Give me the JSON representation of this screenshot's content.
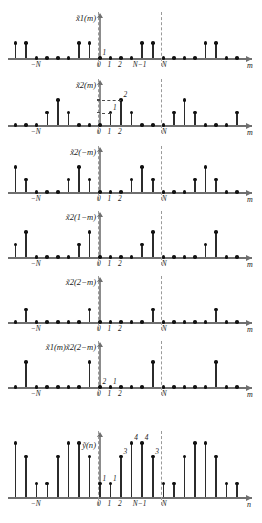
{
  "figure": {
    "caption": "",
    "x_axis_name_m": "m",
    "x_axis_name_n": "n",
    "period_label_N": "N",
    "period_label_negN": "−N",
    "period_label_Nm1": "N−1",
    "tick_0": "0",
    "tick_1": "1",
    "tick_2": "2",
    "colors": {
      "stem": "#2b2b2b",
      "axis": "#6f6f6f",
      "dashed": "#9a9a9a",
      "text": "#1a1a1a"
    }
  },
  "panels": [
    {
      "id": "panel-x1m",
      "title": "x̃1(m)",
      "title_parts": {
        "base": "x̃",
        "sub": "1",
        "arg": "(m)"
      },
      "xaxis": "m",
      "value_labels": [
        {
          "text": "1",
          "index": 0
        }
      ],
      "ticks": [
        "−N",
        "0",
        "1",
        "2",
        "N−1",
        "N"
      ],
      "samples": [
        0,
        0,
        0,
        0,
        1,
        1,
        1,
        1,
        0,
        0,
        0,
        1,
        1,
        1,
        1,
        0,
        0,
        0,
        1,
        1,
        1,
        1,
        0,
        0,
        0
      ],
      "description": "periodic rectangular pulse train of amplitude 1, period N"
    },
    {
      "id": "panel-x2m",
      "title": "x̃2(m)",
      "title_parts": {
        "base": "x̃",
        "sub": "2",
        "arg": "(m)"
      },
      "xaxis": "m",
      "value_labels": [
        {
          "text": "1",
          "index": 1
        },
        {
          "text": "2",
          "index": 2
        }
      ],
      "ticks": [
        "−N",
        "0",
        "1",
        "2",
        "N"
      ],
      "samples": [
        0,
        1,
        2,
        1,
        0,
        0,
        0,
        0,
        1,
        2,
        1,
        0,
        0,
        0,
        0,
        1,
        2,
        1,
        0,
        0,
        0,
        0,
        1,
        2,
        1
      ],
      "description": "periodic triangular pulse, peak value 2 at m=2"
    },
    {
      "id": "panel-x2-negm",
      "title": "x̃2(−m)",
      "title_parts": {
        "base": "x̃",
        "sub": "2",
        "arg": "(−m)"
      },
      "xaxis": "m",
      "value_labels": [],
      "ticks": [
        "−N",
        "0",
        "1",
        "2",
        "N"
      ],
      "samples": [
        0,
        0,
        0,
        1,
        2,
        1,
        0,
        0,
        0,
        0,
        1,
        2,
        1,
        0,
        0,
        0,
        0,
        1,
        2,
        1,
        0,
        0,
        0,
        0,
        1
      ],
      "description": "time reversed x2"
    },
    {
      "id": "panel-x2-1-m",
      "title": "x̃2(1−m)",
      "title_parts": {
        "base": "x̃",
        "sub": "2",
        "arg": "(1−m)"
      },
      "xaxis": "m",
      "value_labels": [],
      "ticks": [
        "−N",
        "0",
        "1",
        "2",
        "N"
      ],
      "samples": [
        0,
        0,
        0,
        0,
        1,
        2,
        1,
        0,
        0,
        0,
        0,
        1,
        2,
        1,
        0,
        0,
        0,
        0,
        1,
        2,
        1,
        0,
        0,
        0,
        0
      ],
      "description": "time reversed x2 shifted by 1"
    },
    {
      "id": "panel-x2-2-m",
      "title": "x̃2(2−m)",
      "title_parts": {
        "base": "x̃",
        "sub": "2",
        "arg": "(2−m)"
      },
      "xaxis": "m",
      "value_labels": [],
      "ticks": [
        "−N",
        "0",
        "1",
        "2",
        "N"
      ],
      "samples": [
        0,
        0,
        0,
        0,
        0,
        1,
        2,
        1,
        0,
        0,
        0,
        0,
        1,
        2,
        1,
        0,
        0,
        0,
        0,
        1,
        2,
        1,
        0,
        0,
        0
      ],
      "description": "time reversed x2 shifted by 2"
    },
    {
      "id": "panel-product",
      "title": "x̃1(m)x̃2(2−m)",
      "title_parts": {
        "base": "x̃",
        "sub": "1",
        "arg": "(m)",
        "base2": "x̃",
        "sub2": "2",
        "arg2": "(2−m)"
      },
      "xaxis": "m",
      "value_labels": [
        {
          "text": "2",
          "index": 0
        },
        {
          "text": "1",
          "index": 1
        }
      ],
      "ticks": [
        "−N",
        "0",
        "1",
        "2",
        "N"
      ],
      "samples": [
        0,
        0,
        0,
        0,
        0,
        2,
        1,
        0,
        0,
        0,
        0,
        0,
        2,
        1,
        0,
        0,
        0,
        0,
        0,
        2,
        1,
        0,
        0,
        0,
        0
      ],
      "description": "pointwise product, non-zero only where pulses overlap"
    },
    {
      "id": "panel-y",
      "title": "ỹ(n)",
      "title_parts": {
        "base": "ỹ",
        "sub": "",
        "arg": "(n)"
      },
      "xaxis": "n",
      "value_labels": [
        {
          "text": "1",
          "index": 0
        },
        {
          "text": "1",
          "index": 1
        },
        {
          "text": "3",
          "index": 2
        },
        {
          "text": "4",
          "index": 3
        },
        {
          "text": "4",
          "index": 4
        },
        {
          "text": "3",
          "index": 5
        }
      ],
      "ticks": [
        "−N",
        "0",
        "1",
        "2",
        "N−1",
        "N"
      ],
      "samples": [
        1,
        1,
        3,
        4,
        4,
        3,
        1,
        1,
        3,
        4,
        4,
        3,
        1,
        1,
        3,
        4,
        4,
        3,
        1,
        1,
        3,
        4,
        4,
        3,
        1
      ],
      "description": "periodic (circular) convolution result, period N"
    }
  ]
}
